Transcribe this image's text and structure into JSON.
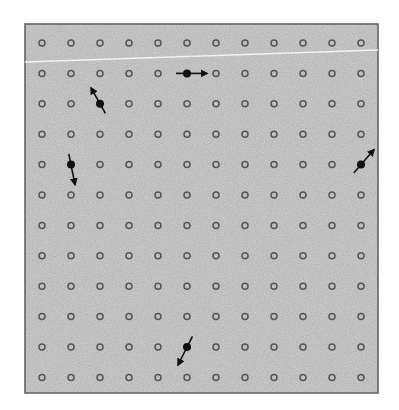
{
  "diagram": {
    "type": "lattice-with-defects",
    "frame": {
      "x": 25,
      "y": 24,
      "width": 353,
      "height": 369,
      "fill": "#d3d3d3",
      "stroke": "#5a5a5a"
    },
    "grid": {
      "cols": 12,
      "rows": 12,
      "x0": 42,
      "dx": 29.0,
      "y0": 43,
      "dy": 30.4,
      "ring_radius": 3,
      "ring_color": "#555555",
      "ring_width": 1.5
    },
    "scan_line": {
      "x1": 25,
      "y1": 62,
      "x2": 378,
      "y2": 50,
      "color": "#f2f2f2"
    },
    "filled_sites": [
      {
        "row": 1,
        "col": 5,
        "direction": "right",
        "dx": 20,
        "dy": 0,
        "tail": 11
      },
      {
        "row": 2,
        "col": 2,
        "direction": "up-left",
        "dx": -9,
        "dy": -16,
        "tail": 11
      },
      {
        "row": 4,
        "col": 1,
        "direction": "down",
        "dx": 4,
        "dy": 20,
        "tail": 11
      },
      {
        "row": 4,
        "col": 11,
        "direction": "up-right",
        "dx": 13,
        "dy": -15,
        "tail": 11
      },
      {
        "row": 10,
        "col": 5,
        "direction": "down-left",
        "dx": -9,
        "dy": 18,
        "tail": 12
      }
    ],
    "dot_color": "#111111"
  }
}
